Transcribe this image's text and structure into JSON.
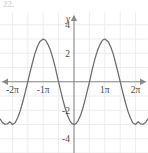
{
  "problem": {
    "number": "22."
  },
  "chart_data": {
    "type": "line",
    "title": "",
    "subtitle": "",
    "xlabel": "",
    "ylabel": "y",
    "function": "y = -3cos(x)",
    "grid": true,
    "legend": false,
    "legend_position": "none",
    "xlim": [
      -7.55,
      7.55
    ],
    "ylim": [
      -5.0,
      4.9
    ],
    "x_tick_labels": [
      "-2π",
      "-1π",
      "1π",
      "2π"
    ],
    "x_tick_values": [
      -6.2832,
      -3.1416,
      3.1416,
      6.2832
    ],
    "y_tick_labels": [
      "4",
      "2",
      "-2",
      "-4"
    ],
    "y_tick_values": [
      4,
      2,
      -2,
      -4
    ],
    "amplitude": 3,
    "period": 6.2832,
    "axis_arrows": {
      "x_left": true,
      "x_right": true,
      "y_top": true
    },
    "series": [
      {
        "name": "y = -3cos(x)",
        "color": "#6b6b6b",
        "x": [
          -7.55,
          -7.3,
          -7.05,
          -6.8,
          -6.55,
          -6.2832,
          -6.0,
          -5.75,
          -5.5,
          -5.25,
          -5.0,
          -4.75,
          -4.5,
          -4.25,
          -4.0,
          -3.75,
          -3.5,
          -3.1416,
          -2.9,
          -2.65,
          -2.4,
          -2.15,
          -1.9,
          -1.65,
          -1.4,
          -1.15,
          -0.9,
          -0.65,
          -0.4,
          -0.2,
          0,
          0.2,
          0.4,
          0.65,
          0.9,
          1.15,
          1.4,
          1.65,
          1.9,
          2.15,
          2.4,
          2.65,
          2.9,
          3.1416,
          3.5,
          3.75,
          4.0,
          4.25,
          4.5,
          4.75,
          5.0,
          5.25,
          5.5,
          5.75,
          6.0,
          6.2832,
          6.55,
          6.8,
          7.05,
          7.3,
          7.55
        ],
        "y": [
          -2.61,
          -2.86,
          -2.98,
          -2.96,
          -2.8,
          -3.0,
          -2.88,
          -2.53,
          -2.06,
          -1.47,
          -0.81,
          -0.1,
          0.62,
          1.3,
          1.96,
          2.44,
          2.81,
          3.0,
          2.92,
          2.61,
          2.21,
          1.64,
          0.98,
          0.2,
          -0.51,
          -1.22,
          -1.86,
          -2.39,
          -2.76,
          -2.94,
          -3.0,
          -2.94,
          -2.76,
          -2.39,
          -1.86,
          -1.22,
          -0.51,
          0.2,
          0.98,
          1.64,
          2.21,
          2.61,
          2.92,
          3.0,
          2.81,
          2.44,
          1.96,
          1.3,
          0.62,
          -0.1,
          -0.81,
          -1.47,
          -2.06,
          -2.53,
          -2.88,
          -3.0,
          -2.8,
          -2.96,
          -2.98,
          -2.86,
          -2.61
        ]
      }
    ]
  },
  "style": {
    "curve_color": "#6b6b6b",
    "axis_color": "#8a8a8a",
    "grid_color": "#ededed",
    "label_color": "#4a4a4a",
    "background": "#ffffff"
  }
}
